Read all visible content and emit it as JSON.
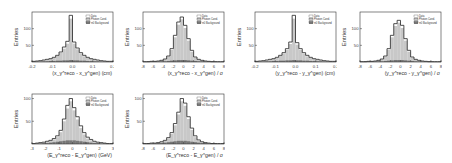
{
  "chart_data": [
    {
      "type": "bar",
      "title": "",
      "xlabel": "(x_γ^reco - x_γ^gen) (cm)",
      "ylabel": "Entries",
      "xlim": [
        -0.2,
        0.2
      ],
      "ylim": [
        0,
        150
      ],
      "xticks": [
        "-0.2",
        "-0.1",
        "0.0",
        "0.1",
        "0.2"
      ],
      "yticks": [
        "50",
        "100"
      ],
      "legend": [
        "Data",
        "Photon Cand.",
        "π0 Background"
      ],
      "series": [
        {
          "name": "Data",
          "values": [
            2,
            3,
            4,
            6,
            8,
            10,
            14,
            20,
            30,
            45,
            62,
            140,
            60,
            42,
            28,
            20,
            14,
            10,
            8,
            6,
            4,
            3,
            2,
            2
          ]
        },
        {
          "name": "Photon Cand.",
          "values": [
            1,
            2,
            3,
            5,
            7,
            9,
            12,
            18,
            27,
            40,
            55,
            130,
            55,
            38,
            25,
            17,
            12,
            9,
            6,
            5,
            3,
            2,
            1,
            1
          ]
        },
        {
          "name": "π0 Background",
          "values": [
            1,
            1,
            1,
            2,
            2,
            3,
            3,
            4,
            4,
            5,
            5,
            6,
            5,
            5,
            4,
            4,
            3,
            3,
            2,
            2,
            1,
            1,
            1,
            1
          ]
        }
      ]
    },
    {
      "type": "bar",
      "title": "",
      "xlabel": "(x_γ^reco - x_γ^gen) / σ",
      "ylabel": "Entries",
      "xlim": [
        -8,
        8
      ],
      "ylim": [
        0,
        150
      ],
      "xticks": [
        "-8",
        "-6",
        "-4",
        "-2",
        "0",
        "2",
        "4",
        "6",
        "8"
      ],
      "yticks": [
        "50",
        "100"
      ],
      "legend": [
        "Data",
        "Photon Cand.",
        "π0 Background"
      ],
      "series": [
        {
          "name": "Data",
          "values": [
            1,
            1,
            2,
            2,
            3,
            5,
            9,
            18,
            40,
            80,
            120,
            135,
            110,
            70,
            35,
            15,
            8,
            5,
            3,
            2,
            1,
            1,
            1,
            1
          ]
        },
        {
          "name": "Photon Cand.",
          "values": [
            1,
            1,
            1,
            2,
            3,
            4,
            8,
            16,
            36,
            74,
            112,
            128,
            102,
            64,
            31,
            13,
            7,
            4,
            2,
            1,
            1,
            1,
            0,
            0
          ]
        },
        {
          "name": "π0 Background",
          "values": [
            0,
            1,
            1,
            1,
            1,
            2,
            2,
            3,
            4,
            5,
            6,
            6,
            6,
            5,
            4,
            3,
            2,
            2,
            1,
            1,
            1,
            0,
            0,
            0
          ]
        }
      ]
    },
    {
      "type": "bar",
      "title": "",
      "xlabel": "(y_γ^reco - y_γ^gen) (cm)",
      "ylabel": "Entries",
      "xlim": [
        -0.2,
        0.2
      ],
      "ylim": [
        0,
        150
      ],
      "xticks": [
        "-0.2",
        "-0.1",
        "0.0",
        "0.1",
        "0.2"
      ],
      "yticks": [
        "50",
        "100"
      ],
      "legend": [
        "Data",
        "Photon Cand.",
        "π0 Background"
      ],
      "series": [
        {
          "name": "Data",
          "values": [
            2,
            3,
            4,
            6,
            8,
            10,
            14,
            20,
            28,
            40,
            60,
            140,
            58,
            40,
            28,
            20,
            14,
            10,
            8,
            6,
            4,
            3,
            2,
            2
          ]
        },
        {
          "name": "Photon Cand.",
          "values": [
            1,
            2,
            3,
            5,
            7,
            9,
            12,
            18,
            25,
            36,
            54,
            130,
            52,
            36,
            25,
            17,
            12,
            9,
            6,
            5,
            3,
            2,
            1,
            1
          ]
        },
        {
          "name": "π0 Background",
          "values": [
            1,
            1,
            1,
            2,
            2,
            3,
            3,
            4,
            4,
            5,
            5,
            6,
            5,
            5,
            4,
            4,
            3,
            3,
            2,
            2,
            1,
            1,
            1,
            1
          ]
        }
      ]
    },
    {
      "type": "bar",
      "title": "",
      "xlabel": "(y_γ^reco - y_γ^gen) / σ",
      "ylabel": "Entries",
      "xlim": [
        -8,
        8
      ],
      "ylim": [
        0,
        150
      ],
      "xticks": [
        "-8",
        "-6",
        "-4",
        "-2",
        "0",
        "2",
        "4",
        "6",
        "8"
      ],
      "yticks": [
        "50",
        "100"
      ],
      "legend": [
        "Data",
        "Photon Cand.",
        "π0 Background"
      ],
      "series": [
        {
          "name": "Data",
          "values": [
            1,
            1,
            2,
            2,
            3,
            5,
            9,
            18,
            40,
            80,
            115,
            125,
            110,
            70,
            35,
            15,
            8,
            5,
            3,
            2,
            1,
            1,
            1,
            1
          ]
        },
        {
          "name": "Photon Cand.",
          "values": [
            1,
            1,
            1,
            2,
            3,
            4,
            8,
            16,
            36,
            74,
            108,
            118,
            102,
            64,
            31,
            13,
            7,
            4,
            2,
            1,
            1,
            1,
            0,
            0
          ]
        },
        {
          "name": "π0 Background",
          "values": [
            0,
            1,
            1,
            1,
            1,
            2,
            2,
            3,
            4,
            5,
            6,
            6,
            6,
            5,
            4,
            3,
            2,
            2,
            1,
            1,
            1,
            0,
            0,
            0
          ]
        }
      ]
    },
    {
      "type": "bar",
      "title": "",
      "xlabel": "(E_γ^reco - E_γ^gen) (GeV)",
      "ylabel": "Entries",
      "xlim": [
        -3,
        3
      ],
      "ylim": [
        0,
        110
      ],
      "xticks": [
        "-3",
        "-2",
        "-1",
        "0",
        "1",
        "2",
        "3"
      ],
      "yticks": [
        "50",
        "100"
      ],
      "legend": [
        "Data",
        "Photon Cand.",
        "π0 Background"
      ],
      "series": [
        {
          "name": "Data",
          "values": [
            1,
            2,
            3,
            4,
            6,
            8,
            12,
            18,
            30,
            55,
            85,
            100,
            80,
            60,
            40,
            25,
            15,
            10,
            6,
            4,
            3,
            2,
            1,
            1
          ]
        },
        {
          "name": "Photon Cand.",
          "values": [
            1,
            1,
            2,
            3,
            5,
            7,
            10,
            15,
            26,
            50,
            78,
            94,
            74,
            54,
            35,
            21,
            12,
            8,
            5,
            3,
            2,
            1,
            1,
            0
          ]
        },
        {
          "name": "π0 Background",
          "values": [
            0,
            1,
            1,
            2,
            2,
            3,
            4,
            5,
            6,
            7,
            8,
            8,
            8,
            7,
            6,
            5,
            4,
            3,
            2,
            2,
            1,
            1,
            0,
            0
          ]
        }
      ]
    },
    {
      "type": "bar",
      "title": "",
      "xlabel": "(E_γ^reco - E_γ^gen) / σ",
      "ylabel": "Entries",
      "xlim": [
        -8,
        8
      ],
      "ylim": [
        0,
        110
      ],
      "xticks": [
        "-8",
        "-6",
        "-4",
        "-2",
        "0",
        "2",
        "4",
        "6",
        "8"
      ],
      "yticks": [
        "50",
        "100"
      ],
      "legend": [
        "Data",
        "Photon Cand.",
        "π0 Background"
      ],
      "series": [
        {
          "name": "Data",
          "values": [
            1,
            1,
            2,
            2,
            3,
            5,
            8,
            14,
            25,
            45,
            70,
            100,
            90,
            60,
            35,
            18,
            9,
            5,
            3,
            2,
            1,
            1,
            1,
            1
          ]
        },
        {
          "name": "Photon Cand.",
          "values": [
            1,
            1,
            1,
            2,
            3,
            4,
            7,
            12,
            22,
            41,
            65,
            94,
            84,
            55,
            31,
            15,
            7,
            4,
            2,
            1,
            1,
            1,
            0,
            0
          ]
        },
        {
          "name": "π0 Background",
          "values": [
            0,
            1,
            1,
            1,
            2,
            2,
            3,
            4,
            5,
            6,
            7,
            7,
            7,
            6,
            5,
            4,
            3,
            2,
            2,
            1,
            1,
            0,
            0,
            0
          ]
        }
      ]
    }
  ],
  "panels": [
    {
      "left": 2,
      "top": 0
    },
    {
      "left": 113,
      "top": 0
    },
    {
      "left": 225,
      "top": 0
    },
    {
      "left": 330,
      "top": 0
    },
    {
      "left": 2,
      "top": 82
    },
    {
      "left": 113,
      "top": 82
    }
  ],
  "colors": {
    "data_line": "#222222",
    "photon_fill": "#c8c8c8",
    "bkg_fill": "#777777",
    "axis": "#333333"
  }
}
